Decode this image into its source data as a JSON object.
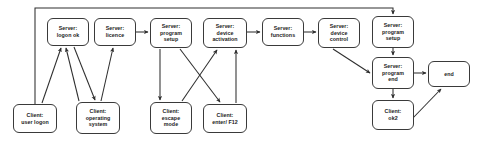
{
  "diagram": {
    "type": "flowchart",
    "stroke_color": "#3a3a3a",
    "node_fill": "#ffffff",
    "text_color": "#1a1a1a",
    "nodes": [
      {
        "id": "server_logon_ok",
        "label": "Server:\nlogon ok",
        "x": 47,
        "y": 18,
        "w": 42,
        "h": 28
      },
      {
        "id": "server_licence",
        "label": "Server:\nlicence",
        "x": 94,
        "y": 18,
        "w": 42,
        "h": 28
      },
      {
        "id": "server_program_setup_1",
        "label": "Server:\nprogram\nsetup",
        "x": 150,
        "y": 18,
        "w": 42,
        "h": 30
      },
      {
        "id": "server_device_activation",
        "label": "Server:\ndevice\nactivation",
        "x": 203,
        "y": 18,
        "w": 44,
        "h": 30
      },
      {
        "id": "server_functions",
        "label": "Server:\nfunctions",
        "x": 262,
        "y": 18,
        "w": 42,
        "h": 28
      },
      {
        "id": "server_device_control",
        "label": "Server:\ndevice\ncontrol",
        "x": 318,
        "y": 18,
        "w": 42,
        "h": 30
      },
      {
        "id": "server_program_setup_2",
        "label": "Server:\nprogram\nsetup",
        "x": 372,
        "y": 16,
        "w": 42,
        "h": 32
      },
      {
        "id": "server_program_end",
        "label": "Server:\nprogram\nend",
        "x": 372,
        "y": 57,
        "w": 42,
        "h": 32
      },
      {
        "id": "end_node",
        "label": "end",
        "x": 428,
        "y": 61,
        "w": 42,
        "h": 26
      },
      {
        "id": "client_user_logon",
        "label": "Client:\nuser logon",
        "x": 13,
        "y": 104,
        "w": 44,
        "h": 29
      },
      {
        "id": "client_operating_system",
        "label": "Client:\noperating\nsystem",
        "x": 76,
        "y": 102,
        "w": 44,
        "h": 32
      },
      {
        "id": "client_escape_mode",
        "label": "Client:\nescape\nmode",
        "x": 150,
        "y": 102,
        "w": 42,
        "h": 32
      },
      {
        "id": "client_enter_f12",
        "label": "Client:\nenter/ F12",
        "x": 203,
        "y": 104,
        "w": 44,
        "h": 29
      },
      {
        "id": "client_ok2",
        "label": "Client:\nok2",
        "x": 372,
        "y": 100,
        "w": 42,
        "h": 30
      }
    ],
    "edges": [
      {
        "id": "e-user-logon-to-logon-ok",
        "from": "client_user_logon",
        "to": "server_logon_ok",
        "arrow": true
      },
      {
        "id": "e-logon-ok-to-operating-system",
        "from": "server_logon_ok",
        "to": "client_operating_system",
        "arrow": true
      },
      {
        "id": "e-operating-system-to-logon-ok",
        "from": "client_operating_system",
        "to": "server_logon_ok",
        "arrow": true
      },
      {
        "id": "e-operating-system-to-licence",
        "from": "client_operating_system",
        "to": "server_licence",
        "arrow": true
      },
      {
        "id": "e-licence-to-program-setup",
        "from": "server_licence",
        "to": "server_program_setup_1",
        "arrow": true
      },
      {
        "id": "e-program-setup-to-escape-mode",
        "from": "server_program_setup_1",
        "to": "client_escape_mode",
        "arrow": true
      },
      {
        "id": "e-program-setup-to-enter-f12",
        "from": "server_program_setup_1",
        "to": "client_enter_f12",
        "arrow": true
      },
      {
        "id": "e-escape-mode-to-device-activation",
        "from": "client_escape_mode",
        "to": "server_device_activation",
        "arrow": true
      },
      {
        "id": "e-enter-f12-to-device-activation",
        "from": "client_enter_f12",
        "to": "server_device_activation",
        "arrow": true
      },
      {
        "id": "e-device-activation-to-functions",
        "from": "server_device_activation",
        "to": "server_functions",
        "arrow": true
      },
      {
        "id": "e-functions-to-device-control",
        "from": "server_functions",
        "to": "server_device_control",
        "arrow": true
      },
      {
        "id": "e-device-control-to-program-end",
        "from": "server_device_control",
        "to": "server_program_end",
        "arrow": true
      },
      {
        "id": "e-program-setup2-to-program-end",
        "from": "server_program_setup_2",
        "to": "server_program_end",
        "arrow": true
      },
      {
        "id": "e-program-end-to-end",
        "from": "server_program_end",
        "to": "end_node",
        "arrow": true
      },
      {
        "id": "e-program-end-to-ok2",
        "from": "server_program_end",
        "to": "client_ok2",
        "arrow": true
      },
      {
        "id": "e-ok2-to-end",
        "from": "client_ok2",
        "to": "end_node",
        "arrow": true
      },
      {
        "id": "e-feedback-loop-to-program-setup2",
        "from": "client_user_logon",
        "to": "server_program_setup_2",
        "arrow": true,
        "routing": "orthogonal-top"
      }
    ]
  }
}
